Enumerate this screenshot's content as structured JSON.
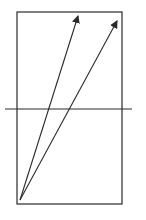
{
  "diagram": {
    "background": "#ffffff",
    "stroke_color": "#2a2a2a",
    "rectangle": {
      "x": 17,
      "y": 12,
      "width": 105,
      "height": 192
    },
    "horizontal_line": {
      "x1": 5,
      "y1": 109,
      "x2": 132,
      "y2": 109
    },
    "arrows": [
      {
        "name": "arrow-left",
        "x1": 20,
        "y1": 200,
        "x2": 78,
        "y2": 16
      },
      {
        "name": "arrow-right",
        "x1": 20,
        "y1": 200,
        "x2": 117,
        "y2": 21
      }
    ]
  }
}
